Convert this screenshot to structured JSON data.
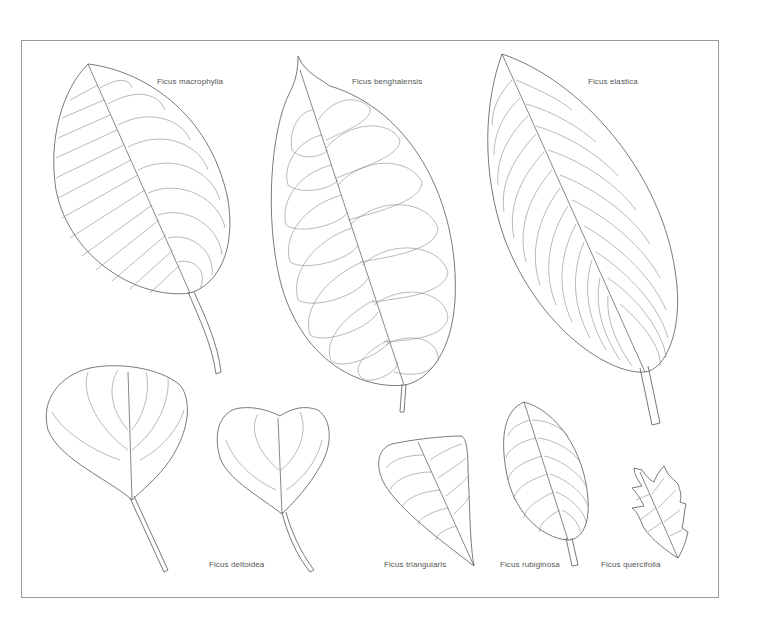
{
  "plate": {
    "frame_color": "#9a9a9a",
    "line_color": "#6a6a6a",
    "label_color": "#555555"
  },
  "leaves": [
    {
      "id": "macrophylla",
      "label": "Ficus macrophylla"
    },
    {
      "id": "benghalensis",
      "label": "Ficus benghalensis"
    },
    {
      "id": "elastica",
      "label": "Ficus elastica"
    },
    {
      "id": "deltoidea",
      "label": "Ficus deltoidea"
    },
    {
      "id": "triangularis",
      "label": "Ficus triangularis"
    },
    {
      "id": "rubiginosa",
      "label": "Ficus rubiginosa"
    },
    {
      "id": "quercifolia",
      "label": "Ficus quercifolia"
    }
  ]
}
